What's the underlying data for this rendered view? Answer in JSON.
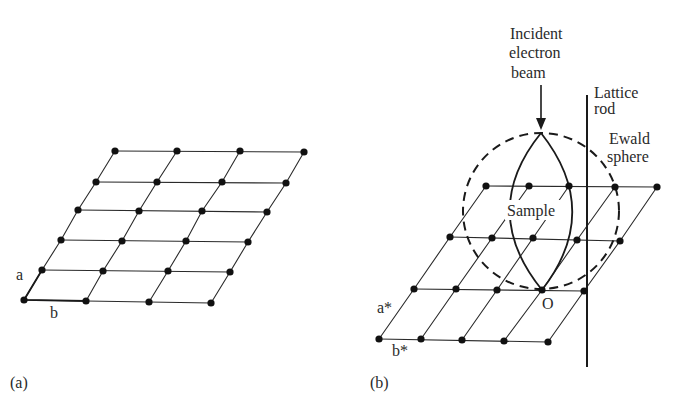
{
  "panel_a": {
    "caption": "(a)",
    "label_a": "a",
    "label_b": "b",
    "lattice_rows": [
      [
        [
          24,
          300
        ],
        [
          86,
          301
        ],
        [
          149,
          302
        ],
        [
          211,
          303
        ]
      ],
      [
        [
          42,
          270
        ],
        [
          103,
          271
        ],
        [
          168,
          271
        ],
        [
          230,
          272
        ]
      ],
      [
        [
          61,
          240
        ],
        [
          122,
          241
        ],
        [
          186,
          241
        ],
        [
          248,
          242
        ]
      ],
      [
        [
          78,
          210
        ],
        [
          139,
          211
        ],
        [
          202,
          211
        ],
        [
          267,
          212
        ]
      ],
      [
        [
          96,
          182
        ],
        [
          157,
          182
        ],
        [
          222,
          182
        ],
        [
          286,
          183
        ]
      ],
      [
        [
          115,
          151
        ],
        [
          177,
          151
        ],
        [
          240,
          151
        ],
        [
          304,
          152
        ]
      ]
    ]
  },
  "panel_b": {
    "caption": "(b)",
    "label_a_star": "a*",
    "label_b_star": "b*",
    "label_origin": "O",
    "label_sample": "Sample",
    "beam_label": [
      "Incident",
      "electron",
      "beam"
    ],
    "rod_label": [
      "Lattice",
      "rod"
    ],
    "sphere_label": [
      "Ewald",
      "sphere"
    ],
    "lattice_rows": [
      [
        [
          379,
          339
        ],
        [
          421,
          339
        ],
        [
          462,
          340
        ],
        [
          504,
          341
        ],
        [
          548,
          342
        ]
      ],
      [
        [
          414,
          289
        ],
        [
          456,
          289
        ],
        [
          497,
          290
        ],
        [
          542,
          290
        ],
        [
          584,
          291
        ]
      ],
      [
        [
          450,
          237
        ],
        [
          492,
          238
        ],
        [
          533,
          238
        ],
        [
          577,
          240
        ],
        [
          620,
          241
        ]
      ],
      [
        [
          486,
          186
        ],
        [
          529,
          186
        ],
        [
          569,
          186
        ],
        [
          615,
          187
        ],
        [
          657,
          187
        ]
      ]
    ],
    "sphere": {
      "cx": 541,
      "cy": 211,
      "r": 78
    },
    "colors": {
      "ink": "#1a1a1a",
      "background": "#ffffff"
    }
  }
}
